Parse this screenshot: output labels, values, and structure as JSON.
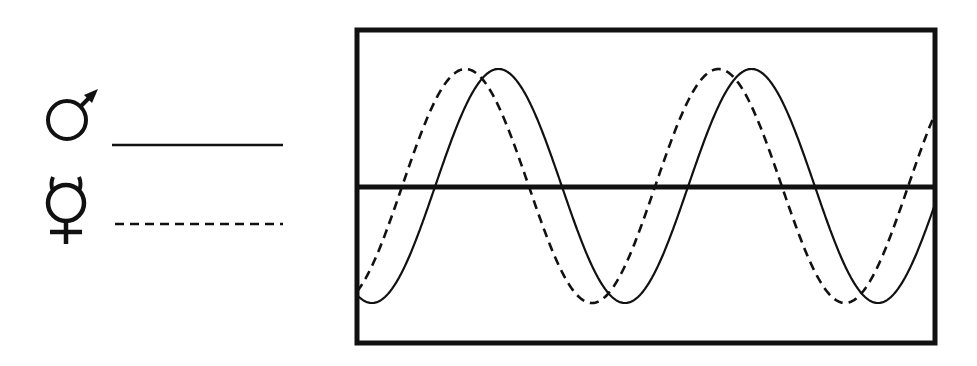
{
  "legend": {
    "items": [
      {
        "symbol_name": "mars-male-icon",
        "symbol": "♂",
        "label": "male",
        "line_style": "solid"
      },
      {
        "symbol_name": "mercury-hermaphrodite-icon",
        "symbol": "☿",
        "label": "hermaphrodite",
        "line_style": "dashed"
      }
    ]
  },
  "colors": {
    "ink": "#111111",
    "background": "#ffffff"
  },
  "plot": {
    "frame": {
      "x": 357,
      "y": 30,
      "width": 578,
      "height": 313,
      "stroke": 5
    },
    "midline_y": 187,
    "midline_stroke": 5,
    "center_y": 186,
    "amplitude": 117,
    "period_px": 253,
    "series": [
      {
        "name": "male",
        "style": "solid",
        "trough_x": 372,
        "stroke": 2.2,
        "dash": ""
      },
      {
        "name": "hermaphrodite",
        "style": "dashed",
        "trough_x": 339,
        "stroke": 2.6,
        "dash": "9 6"
      }
    ]
  },
  "chart_data": {
    "type": "line",
    "title": "",
    "xlabel": "",
    "ylabel": "",
    "series": [
      {
        "name": "male (♂)",
        "style": "solid",
        "period_cycles_visible": 2.3,
        "phase_offset_cycles": 0.0
      },
      {
        "name": "hermaphrodite (☿)",
        "style": "dashed",
        "period_cycles_visible": 2.3,
        "phase_offset_cycles": -0.13
      }
    ],
    "grid": false,
    "legend_position": "left"
  }
}
